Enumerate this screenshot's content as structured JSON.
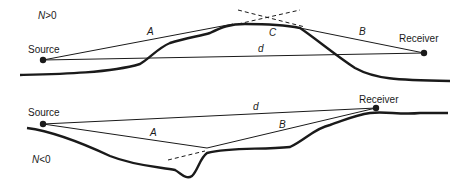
{
  "panels": [
    {
      "id": "top",
      "condition": "N>0",
      "condition_parts": {
        "var": "N",
        "rel": ">0"
      },
      "source_label": "Source",
      "receiver_label": "Receiver",
      "path_labels": {
        "a": "A",
        "b": "B",
        "c": "C",
        "d": "d"
      }
    },
    {
      "id": "bottom",
      "condition": "N<0",
      "condition_parts": {
        "var": "N",
        "rel": "<0"
      },
      "source_label": "Source",
      "receiver_label": "Receiver",
      "path_labels": {
        "a": "A",
        "b": "B",
        "d": "d"
      }
    }
  ],
  "colors": {
    "line": "#1a1a1a",
    "background": "#ffffff"
  }
}
